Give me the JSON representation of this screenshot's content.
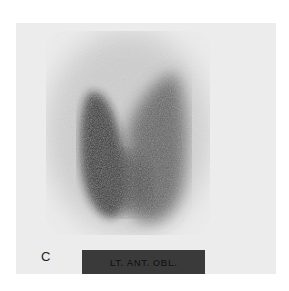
{
  "figure": {
    "panel_letter": "C",
    "view_label": "LT. ANT. OBL.",
    "image_description": "Thyroid scintigram (nuclear medicine scan), left anterior oblique view",
    "colors": {
      "background": "#ececec",
      "label_box": "#3a3a3a",
      "uptake_dark": "#1e1e1e"
    }
  }
}
